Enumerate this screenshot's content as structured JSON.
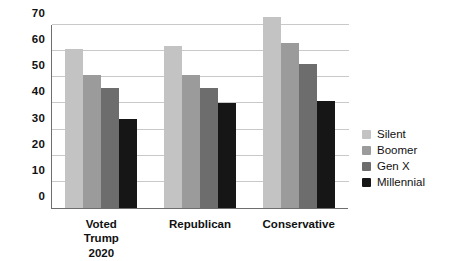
{
  "chart_data": {
    "type": "bar",
    "title": "",
    "subtitle": "",
    "xlabel": "",
    "ylabel": "",
    "ylim": [
      0,
      70
    ],
    "yticks": [
      0,
      10,
      20,
      30,
      40,
      50,
      60,
      70
    ],
    "grid": "horizontal",
    "legend_position": "right",
    "categories": [
      "Voted Trump\n2020",
      "Republican",
      "Conservative"
    ],
    "series": [
      {
        "name": "Silent",
        "color": "#c3c3c3",
        "values": [
          61,
          62,
          73
        ]
      },
      {
        "name": "Boomer",
        "color": "#9b9b9b",
        "values": [
          51,
          51,
          63
        ]
      },
      {
        "name": "Gen X",
        "color": "#6d6d6d",
        "values": [
          46,
          46,
          55
        ]
      },
      {
        "name": "Millennial",
        "color": "#161616",
        "values": [
          34,
          40,
          41
        ]
      }
    ]
  },
  "legend": {
    "items": [
      {
        "label": "Silent"
      },
      {
        "label": "Boomer"
      },
      {
        "label": "Gen X"
      },
      {
        "label": "Millennial"
      }
    ]
  },
  "axis": {
    "tick_labels": [
      "70",
      "60",
      "50",
      "40",
      "30",
      "20",
      "10",
      "0"
    ]
  }
}
